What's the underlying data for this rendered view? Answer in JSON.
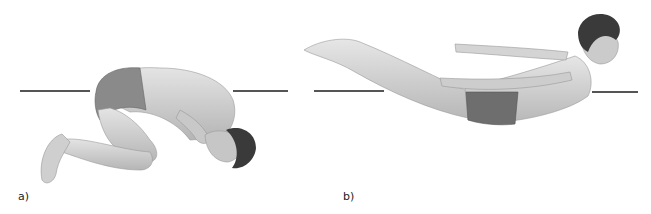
{
  "figure": {
    "panels": [
      {
        "id": "a",
        "label": "a)",
        "description": "Man curled in flexed (fetal-like) posture, head tucked to knees, kneeling on side",
        "reference_line": {
          "left": [
            20,
            90
          ],
          "right": [
            233,
            288
          ],
          "y": 90
        }
      },
      {
        "id": "b",
        "label": "b)",
        "description": "Man in extended (superman) posture, arms and legs raised, body arched",
        "reference_line": {
          "left": [
            314,
            384
          ],
          "right": [
            592,
            638
          ],
          "y": 90
        }
      }
    ],
    "colors": {
      "background": "#ffffff",
      "skin": "#d6d6d6",
      "skin_shadow": "#a8a8a8",
      "shorts": "#6e6e6e",
      "hair": "#3a3a3a",
      "line": "#555555"
    }
  }
}
